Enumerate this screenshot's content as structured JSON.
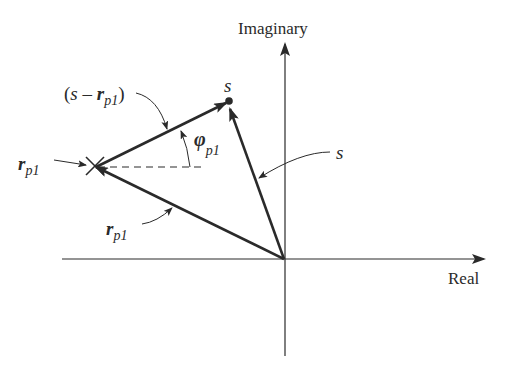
{
  "diagram": {
    "axes": {
      "imaginary_label": "Imaginary",
      "real_label": "Real"
    },
    "labels": {
      "s_point": "s",
      "s_vector": "s",
      "s_minus_rp1_open": "(",
      "s_minus_rp1_s": "s",
      "s_minus_rp1_minus": " – ",
      "s_minus_rp1_r": "r",
      "s_minus_rp1_sub": "p1",
      "s_minus_rp1_close": ")",
      "rp1_pole_r": "r",
      "rp1_pole_sub": "p1",
      "rp1_vector_r": "r",
      "rp1_vector_sub": "p1",
      "phi": "φ",
      "phi_sub": "p1"
    },
    "colors": {
      "ink": "#2a2a2a",
      "background": "#ffffff"
    }
  }
}
